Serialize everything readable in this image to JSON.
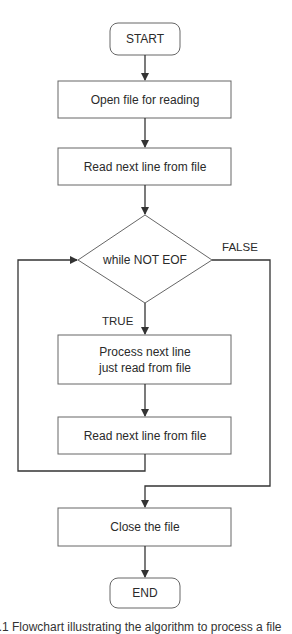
{
  "flowchart": {
    "start": "START",
    "open_file": "Open file for reading",
    "read_first": "Read next line from file",
    "decision": "while NOT EOF",
    "true_label": "TRUE",
    "false_label": "FALSE",
    "process_line1": "Process next line",
    "process_line2": "just read from file",
    "read_next": "Read next line from file",
    "close_file": "Close the file",
    "end": "END"
  },
  "caption": "1.1 Flowchart illustrating the algorithm to process a file",
  "colors": {
    "stroke": "#555555",
    "arrow": "#333333",
    "text": "#2a2a2a"
  }
}
